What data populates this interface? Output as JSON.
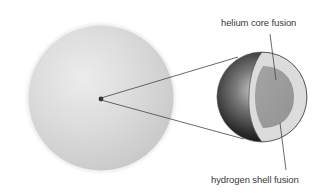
{
  "diagram": {
    "title": "",
    "labels": {
      "helium": "helium core fusion",
      "hydrogen": "hydrogen shell fusion"
    },
    "parts": {
      "star": "star-sphere",
      "core_point": "core-point",
      "cutaway": "core-cutaway",
      "helium_core": "helium-core",
      "hydrogen_shell": "hydrogen-shell"
    },
    "colors": {
      "star_fill": "#d9d9d9",
      "star_edge": "#c4c4c4",
      "core_dot": "#333333",
      "sphere_dark": "#1e1e1e",
      "sphere_light": "#b0b0b0",
      "shell": "#dcdcdc",
      "helium_core": "#9e9e9e",
      "line": "#444444"
    }
  }
}
